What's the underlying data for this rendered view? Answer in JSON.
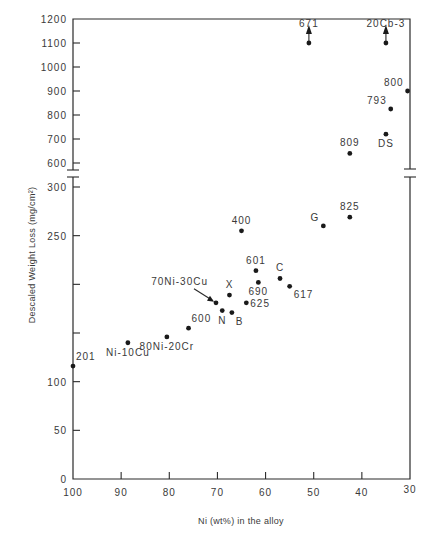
{
  "chart_data": {
    "type": "scatter",
    "title": "",
    "xlabel": "Ni (wt%) in the alloy",
    "ylabel": "Descaled Weight Loss (mg/cm²)",
    "xlim": [
      100,
      30
    ],
    "x_reversed": true,
    "x_ticks": [
      100,
      90,
      80,
      70,
      60,
      50,
      40,
      30
    ],
    "y_axis_broken": true,
    "y_segments": [
      {
        "range": [
          0,
          300
        ],
        "ticks": [
          0,
          50,
          100,
          150,
          200,
          250,
          300
        ],
        "labeled_ticks": [
          0,
          50,
          100,
          250,
          300
        ]
      },
      {
        "range": [
          600,
          1200
        ],
        "ticks": [
          600,
          700,
          800,
          900,
          1000,
          1100,
          1200
        ],
        "labeled_ticks": [
          600,
          700,
          800,
          900,
          1000,
          1100,
          1200
        ]
      }
    ],
    "grid": false,
    "legend": null,
    "points": [
      {
        "label": "201",
        "x": 100,
        "y": 116,
        "label_pos": "above-right"
      },
      {
        "label": "Ni-10Cu",
        "x": 88.6,
        "y": 140,
        "label_pos": "below"
      },
      {
        "label": "80Ni-20Cr",
        "x": 80.5,
        "y": 146,
        "label_pos": "below"
      },
      {
        "label": "600",
        "x": 76,
        "y": 155,
        "label_pos": "above-right"
      },
      {
        "label": "70Ni-30Cu",
        "x": 70.3,
        "y": 181,
        "label_pos": "arrow-upper-left"
      },
      {
        "label": "N",
        "x": 69,
        "y": 173,
        "label_pos": "below"
      },
      {
        "label": "B",
        "x": 67,
        "y": 171,
        "label_pos": "below-right"
      },
      {
        "label": "X",
        "x": 67.5,
        "y": 189,
        "label_pos": "above"
      },
      {
        "label": "625",
        "x": 64,
        "y": 181,
        "label_pos": "right"
      },
      {
        "label": "690",
        "x": 61.5,
        "y": 202,
        "label_pos": "below"
      },
      {
        "label": "601",
        "x": 62,
        "y": 214,
        "label_pos": "above"
      },
      {
        "label": "C",
        "x": 57,
        "y": 206,
        "label_pos": "above"
      },
      {
        "label": "617",
        "x": 55,
        "y": 198,
        "label_pos": "below-right"
      },
      {
        "label": "400",
        "x": 65,
        "y": 255,
        "label_pos": "above"
      },
      {
        "label": "G",
        "x": 48,
        "y": 260,
        "label_pos": "above-left"
      },
      {
        "label": "825",
        "x": 42.5,
        "y": 269,
        "label_pos": "above"
      },
      {
        "label": "809",
        "x": 42.5,
        "y": 640,
        "label_pos": "above"
      },
      {
        "label": "DS",
        "x": 35,
        "y": 720,
        "label_pos": "below"
      },
      {
        "label": "793",
        "x": 34,
        "y": 825,
        "label_pos": "above-left"
      },
      {
        "label": "800",
        "x": 30.5,
        "y": 900,
        "label_pos": "above-left"
      },
      {
        "label": "671",
        "x": 51,
        "y": 1100,
        "label_pos": "top",
        "arrow_up": true,
        "note": ">1100 (off scale)"
      },
      {
        "label": "20Cb-3",
        "x": 35,
        "y": 1100,
        "label_pos": "top",
        "arrow_up": true,
        "note": ">1100 (off scale)"
      }
    ]
  }
}
